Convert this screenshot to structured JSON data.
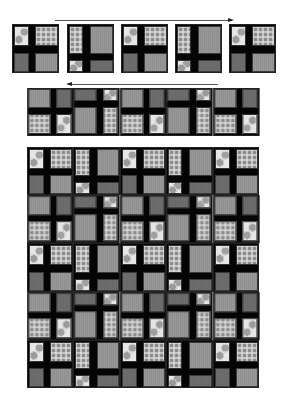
{
  "diagram": {
    "title": "",
    "fabrics": {
      "lg": {
        "name": "large-dot print",
        "color": "#e6e6e6"
      },
      "sm": {
        "name": "small-dot print",
        "color": "#d8d8d8"
      },
      "dark": {
        "name": "dark gray solid",
        "color": "#6e6e6e"
      },
      "mid": {
        "name": "medium gray solid",
        "color": "#8f8f8f"
      },
      "sash": {
        "name": "black sashing",
        "color": "#050505"
      }
    },
    "block_types": {
      "a": {
        "vbar": [
          16,
          22
        ],
        "hbar": [
          21,
          27
        ],
        "TL": "lg",
        "TR": "sm",
        "BL": "dark",
        "BR": "mid"
      },
      "b": {
        "vbar": [
          15,
          22
        ],
        "hbar": [
          28,
          34
        ],
        "TL": "sm",
        "TR": "mid",
        "BL": "lg",
        "BR": "dark"
      }
    },
    "step1": {
      "arrow_direction": "right",
      "blocks": [
        "a",
        "b",
        "a",
        "b",
        "a"
      ]
    },
    "step2": {
      "arrow_direction": "left",
      "blocks": [
        "a180",
        "b180",
        "a180",
        "b180",
        "a180"
      ],
      "note": "Strip of blocks rotated 180 degrees"
    },
    "step3": {
      "rows": [
        [
          "a",
          "b",
          "a",
          "b",
          "a"
        ],
        [
          "a180",
          "b180",
          "a180",
          "b180",
          "a180"
        ],
        [
          "a",
          "b",
          "a",
          "b",
          "a"
        ],
        [
          "a180",
          "b180",
          "a180",
          "b180",
          "a180"
        ],
        [
          "a",
          "b",
          "a",
          "b",
          "a"
        ]
      ],
      "block_rows": 5,
      "block_cols": 5
    }
  }
}
